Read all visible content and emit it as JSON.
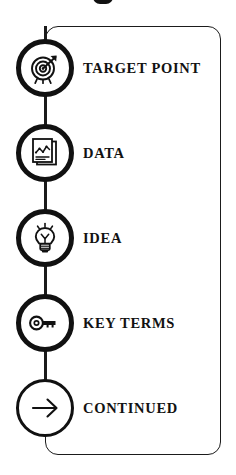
{
  "graphic": {
    "type": "vertical-step-list-infographic",
    "background_color": "#ffffff",
    "line_color": "#111111",
    "text_color": "#121212",
    "title_cropped_text": ""
  },
  "steps": [
    {
      "label": "TARGET POINT",
      "icon": "target-bullseye-arrow-icon"
    },
    {
      "label": "DATA",
      "icon": "document-line-chart-icon"
    },
    {
      "label": "IDEA",
      "icon": "lightbulb-icon"
    },
    {
      "label": "KEY TERMS",
      "icon": "key-icon"
    },
    {
      "label": "CONTINUED",
      "icon": "arrow-right-icon"
    }
  ]
}
